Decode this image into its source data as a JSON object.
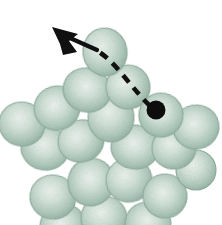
{
  "figure": {
    "background_color": "#ffffff",
    "width": 222,
    "height": 225,
    "description": "Micrograph-style illustration of a packed cluster of pale green oval cells with a dashed trajectory and arrow showing the path of one cell away from the cluster."
  },
  "palette": {
    "cell_rim": "#8fae9f",
    "cell_mid": "#b9d0c4",
    "cell_center": "#e3eee8",
    "cell_shadow": "#7e9e8f",
    "trace_black": "#111111",
    "marker_black": "#0d0d0d",
    "background": "#ffffff"
  },
  "annotations": {
    "trajectory_label": "dashed-trajectory",
    "arrow_label": "direction-arrow",
    "start_marker_label": "start-position-dot",
    "arrow_tip": {
      "x": 52,
      "y": 27
    },
    "start_dot": {
      "x": 156,
      "y": 110
    },
    "dash_pattern": "9 7",
    "stroke_width": 4.6
  },
  "cells": [
    {
      "id": "cell-01",
      "cx": 105,
      "cy": 52,
      "rx": 22,
      "ry": 24,
      "rot": -8
    },
    {
      "id": "cell-02",
      "cx": 87,
      "cy": 90,
      "rx": 24,
      "ry": 22,
      "rot": 14
    },
    {
      "id": "cell-03",
      "cx": 128,
      "cy": 87,
      "rx": 22,
      "ry": 22,
      "rot": -12
    },
    {
      "id": "cell-04",
      "cx": 161,
      "cy": 115,
      "rx": 22,
      "ry": 22,
      "rot": 10
    },
    {
      "id": "cell-05",
      "cx": 57,
      "cy": 108,
      "rx": 23,
      "ry": 22,
      "rot": -16
    },
    {
      "id": "cell-06",
      "cx": 22,
      "cy": 124,
      "rx": 23,
      "ry": 22,
      "rot": 12
    },
    {
      "id": "cell-07",
      "cx": 111,
      "cy": 118,
      "rx": 23,
      "ry": 24,
      "rot": 6
    },
    {
      "id": "cell-08",
      "cx": 196,
      "cy": 127,
      "rx": 23,
      "ry": 22,
      "rot": -10
    },
    {
      "id": "cell-09",
      "cx": 45,
      "cy": 148,
      "rx": 24,
      "ry": 22,
      "rot": 10
    },
    {
      "id": "cell-10",
      "cx": 81,
      "cy": 141,
      "rx": 23,
      "ry": 21,
      "rot": -14
    },
    {
      "id": "cell-11",
      "cx": 135,
      "cy": 147,
      "rx": 24,
      "ry": 22,
      "rot": 8
    },
    {
      "id": "cell-12",
      "cx": 174,
      "cy": 148,
      "rx": 22,
      "ry": 21,
      "rot": -6
    },
    {
      "id": "cell-13",
      "cx": 91,
      "cy": 182,
      "rx": 23,
      "ry": 24,
      "rot": 12
    },
    {
      "id": "cell-14",
      "cx": 129,
      "cy": 180,
      "rx": 23,
      "ry": 22,
      "rot": -10
    },
    {
      "id": "cell-15",
      "cx": 53,
      "cy": 197,
      "rx": 23,
      "ry": 22,
      "rot": 8
    },
    {
      "id": "cell-16",
      "cx": 165,
      "cy": 196,
      "rx": 22,
      "ry": 22,
      "rot": -8
    },
    {
      "id": "cell-17",
      "cx": 104,
      "cy": 218,
      "rx": 23,
      "ry": 22,
      "rot": 6
    },
    {
      "id": "cell-18",
      "cx": 63,
      "cy": 226,
      "rx": 23,
      "ry": 22,
      "rot": -12
    },
    {
      "id": "cell-19",
      "cx": 148,
      "cy": 224,
      "rx": 23,
      "ry": 22,
      "rot": 10
    },
    {
      "id": "cell-20",
      "cx": 196,
      "cy": 170,
      "rx": 20,
      "ry": 20,
      "rot": 0
    }
  ]
}
